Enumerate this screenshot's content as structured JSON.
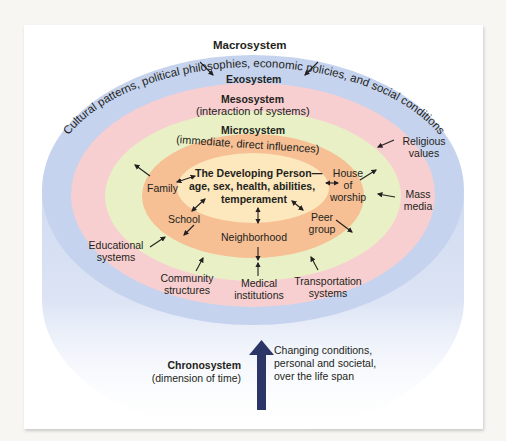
{
  "diagram": {
    "colors": {
      "macrosystem": "#c6d3ee",
      "exosystem": "#f8cfd0",
      "mesosystem": "#e9f0c6",
      "microsystem": "#f6bf94",
      "center": "#fde7bd",
      "arrow": "#2f3a6a",
      "chrono_arrow": "#2b3566"
    },
    "macrosystem": {
      "label": "Macrosystem",
      "arc_text": "Cultural patterns, political philosophies, economic policies, and social conditions"
    },
    "exosystem": {
      "label": "Exosystem",
      "items": [
        {
          "label": "Religious values"
        },
        {
          "label": "Mass media"
        },
        {
          "label": "Educational systems"
        },
        {
          "label": "Community structures"
        },
        {
          "label": "Medical institutions"
        },
        {
          "label": "Transportation systems"
        }
      ]
    },
    "mesosystem": {
      "label": "Mesosystem",
      "sublabel": "(interaction of systems)"
    },
    "microsystem": {
      "label": "Microsystem",
      "sublabel": "(immediate, direct influences)",
      "items": [
        {
          "label": "Family"
        },
        {
          "label": "School"
        },
        {
          "label": "Neighborhood"
        },
        {
          "label": "Peer group"
        },
        {
          "label": "House of worship"
        }
      ]
    },
    "center": {
      "line1": "The Developing Person—",
      "line2": "age, sex, health, abilities,",
      "line3": "temperament"
    },
    "chronosystem": {
      "label": "Chronosystem",
      "sublabel": "(dimension of time)",
      "description_lines": [
        "Changing conditions,",
        "personal and societal,",
        "over the life span"
      ]
    }
  }
}
